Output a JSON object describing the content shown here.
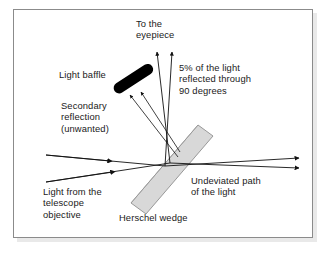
{
  "figure": {
    "background_color": "#ffffff",
    "border_color": "#8b8b8b",
    "text_color": "#1a1a1a"
  },
  "labels": {
    "eyepiece": "To the\neyepiece",
    "five_percent": "5% of the light\nreflected through\n90 degrees",
    "light_baffle": "Light baffle",
    "secondary_reflection": "Secondary\nreflection\n(unwanted)",
    "light_source": "Light from the\ntelescope\nobjective",
    "herschel_wedge": "Herschel wedge",
    "undeviated_path": "Undeviated path\nof the light"
  },
  "elements": {
    "wedge": {
      "name": "Herschel wedge",
      "fill_color": "#d8d8d8",
      "stroke_color": "#8f8f8f"
    },
    "baffle": {
      "name": "Light baffle",
      "fill_color": "#000000"
    },
    "rays": {
      "incoming_color": "#111111",
      "outgoing_color": "#111111",
      "reflected_color": "#111111",
      "count_incoming": 2,
      "count_outgoing": 2,
      "count_to_eyepiece": 2,
      "count_secondary": 2
    }
  }
}
